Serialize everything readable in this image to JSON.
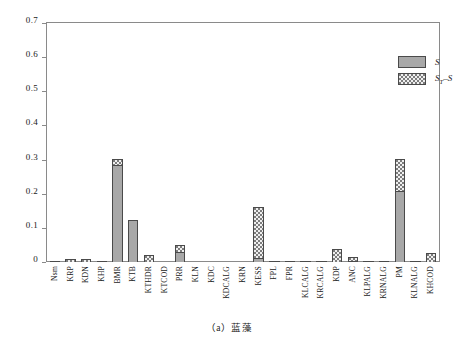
{
  "caption": "（a）蓝藻",
  "legend": {
    "position": "top-right",
    "items": [
      {
        "key": "S",
        "label_main": "S",
        "label_sub": "",
        "label_tail": "",
        "swatch": "solid-gray"
      },
      {
        "key": "ST-S",
        "label_main": "S",
        "label_sub": "T",
        "label_tail": "–S",
        "swatch": "checker"
      }
    ]
  },
  "colors": {
    "bar_s": "#a8a8a8",
    "bar_ts_base": "#7d7d7d",
    "bar_ts_check": "#efefef",
    "bar_outline": "#4a4a4a",
    "axis": "#8a8a8a",
    "text": "#1a1a1a"
  },
  "chart_data": {
    "type": "bar",
    "title": "",
    "subtitle": "",
    "xlabel": "",
    "ylabel": "",
    "ylim": [
      0,
      0.7
    ],
    "yticks": [
      0,
      0.1,
      0.2,
      0.3,
      0.4,
      0.5,
      0.6,
      0.7
    ],
    "ytick_labels": [
      "0",
      "0.1",
      "0.2",
      "0.3",
      "0.4",
      "0.5",
      "0.6",
      "0.7"
    ],
    "grid": false,
    "stacked": true,
    "legend_position": "top-right",
    "categories": [
      "Nsm",
      "KRP",
      "KDN",
      "KHP",
      "BMR",
      "KTB",
      "KTHDR",
      "KTCOD",
      "PRR",
      "KLN",
      "KDC",
      "KDCALG",
      "KRN",
      "KESS",
      "FPL",
      "FPR",
      "KLCALG",
      "KRCALG",
      "KDP",
      "ANC",
      "KLPALG",
      "KRNALG",
      "PM",
      "KLNALG",
      "KHCOD"
    ],
    "series": [
      {
        "name": "S",
        "values": [
          0.002,
          0.0,
          0.0,
          0.001,
          0.285,
          0.123,
          0.0,
          0.0,
          0.03,
          0.0,
          0.0,
          0.0,
          0.0,
          0.012,
          0.001,
          0.001,
          0.001,
          0.001,
          0.0,
          0.001,
          0.001,
          0.001,
          0.207,
          0.001,
          0.0
        ]
      },
      {
        "name": "ST-S",
        "values": [
          0.0,
          0.01,
          0.009,
          0.0,
          0.018,
          0.0,
          0.02,
          0.0,
          0.02,
          0.0,
          0.0,
          0.0,
          0.0,
          0.15,
          0.0,
          0.0,
          0.0,
          0.0,
          0.039,
          0.01,
          0.0,
          0.0,
          0.096,
          0.0,
          0.026
        ]
      }
    ]
  }
}
